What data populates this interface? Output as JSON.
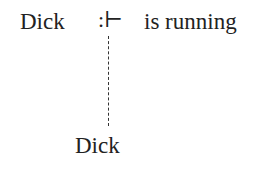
{
  "diagram": {
    "subject": "Dick",
    "operator": ":⊢",
    "predicate": "is running",
    "referent": "Dick"
  }
}
